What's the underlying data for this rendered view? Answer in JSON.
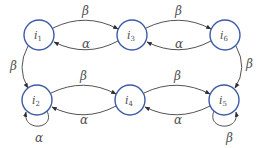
{
  "diagram": {
    "type": "state-transition-graph",
    "colors": {
      "node_stroke": "#3c5aa8",
      "edge": "#404040",
      "text": "#505050"
    },
    "nodes": [
      {
        "id": "i1",
        "base": "i",
        "sub": "1"
      },
      {
        "id": "i3",
        "base": "i",
        "sub": "3"
      },
      {
        "id": "i6",
        "base": "i",
        "sub": "6"
      },
      {
        "id": "i2",
        "base": "i",
        "sub": "2"
      },
      {
        "id": "i4",
        "base": "i",
        "sub": "4"
      },
      {
        "id": "i5",
        "base": "i",
        "sub": "5"
      }
    ],
    "edges": [
      {
        "from": "i1",
        "to": "i3",
        "label": "β"
      },
      {
        "from": "i3",
        "to": "i1",
        "label": "α"
      },
      {
        "from": "i3",
        "to": "i6",
        "label": "β"
      },
      {
        "from": "i6",
        "to": "i3",
        "label": "α"
      },
      {
        "from": "i1",
        "to": "i2",
        "label": "β"
      },
      {
        "from": "i6",
        "to": "i5",
        "label": "β"
      },
      {
        "from": "i2",
        "to": "i4",
        "label": "β"
      },
      {
        "from": "i4",
        "to": "i2",
        "label": "α"
      },
      {
        "from": "i4",
        "to": "i5",
        "label": "β"
      },
      {
        "from": "i5",
        "to": "i4",
        "label": "α"
      },
      {
        "from": "i2",
        "to": "i2",
        "label": "α"
      },
      {
        "from": "i5",
        "to": "i5",
        "label": "β"
      }
    ]
  }
}
